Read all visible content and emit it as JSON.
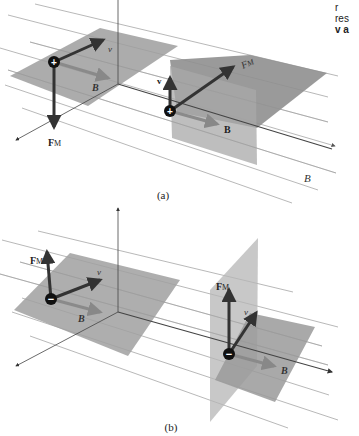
{
  "figure": {
    "panel_a": {
      "caption": "(a)",
      "charge_left": "+",
      "charge_right": "+",
      "labels": {
        "v_left": "v",
        "B_left": "B",
        "F_left": "F",
        "F_left_sub": "M",
        "v_right": "v",
        "B_right": "B",
        "F_right": "F",
        "F_right_sub": "M",
        "B_field": "B"
      }
    },
    "panel_b": {
      "caption": "(b)",
      "charge_left": "−",
      "charge_right": "−",
      "labels": {
        "v_left": "v",
        "B_left": "B",
        "F_left": "F",
        "F_left_sub": "M",
        "v_right": "v",
        "B_right": "B",
        "F_right": "F",
        "F_right_sub": "M"
      }
    },
    "side_text": {
      "line1": "r",
      "line2": "res",
      "line3": "v a"
    },
    "colors": {
      "plane": "#9a9a9a",
      "plane_light": "#b8b8b8",
      "field_line": "#888888",
      "vector": "#3a3a3a",
      "b_vector": "#8c8c8c",
      "charge": "#111111"
    }
  }
}
